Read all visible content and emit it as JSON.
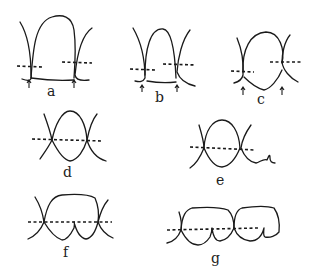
{
  "figure": {
    "panels": [
      {
        "id": "a",
        "label": "a",
        "description": "single tooth with contact points marked by arrows, dashed lines at two heights"
      },
      {
        "id": "b",
        "label": "b",
        "description": "narrower tooth with contact points marked by arrows, dashed lines at two heights"
      },
      {
        "id": "c",
        "label": "c",
        "description": "rounded tooth with contact points marked by arrows, dashed lines at two heights"
      },
      {
        "id": "d",
        "label": "d",
        "description": "oval tooth with single dashed line through contacts"
      },
      {
        "id": "e",
        "label": "e",
        "description": "oval tooth with dashed line through contacts and adjacent curve"
      },
      {
        "id": "f",
        "label": "f",
        "description": "wide molar-like tooth with dashed line"
      },
      {
        "id": "g",
        "label": "g",
        "description": "two adjacent molars with dashed line"
      }
    ]
  }
}
